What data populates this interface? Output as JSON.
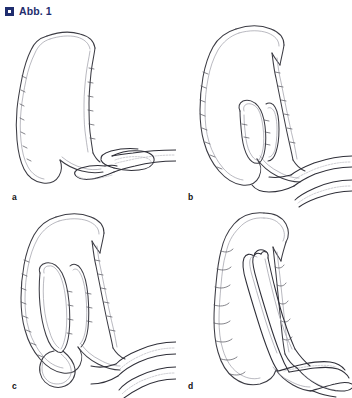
{
  "figure": {
    "marker_icon": "square-bullet-icon",
    "label": "Abb. 1",
    "marker_color": "#1f2d6e",
    "background_color": "#ffffff"
  },
  "panels": [
    {
      "id": "a",
      "label": "a",
      "caption_position": "bottom-left",
      "description": "Colonoscope inserted into rectum forming an early N-shaped loop; descending colon shown at left with haustral wall markings."
    },
    {
      "id": "b",
      "label": "b",
      "caption_position": "bottom-left",
      "description": "Scope advanced further, an alpha/N loop formed within the sigmoid colon, two scope shafts exiting to the lower right."
    },
    {
      "id": "c",
      "label": "c",
      "caption_position": "bottom-left",
      "description": "Loop elongated with the scope tip reaching high into the descending colon; sigmoid loop still distended."
    },
    {
      "id": "d",
      "label": "d",
      "caption_position": "bottom-left",
      "description": "Loop reduced and scope straightened, lying along the shortened haustrated colon with the shaft exiting to the right."
    }
  ],
  "style": {
    "line_color": "#3c3c44",
    "scope_color": "#2f2f38",
    "inner_line_color": "#8e8e98"
  }
}
